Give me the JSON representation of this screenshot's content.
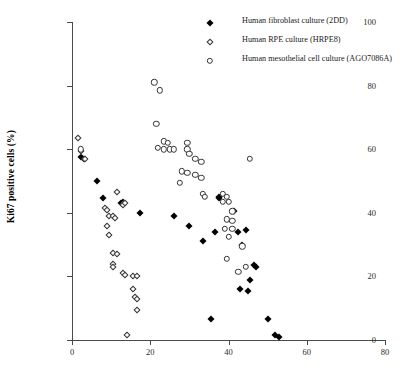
{
  "chart_data": {
    "type": "scatter",
    "title": "",
    "xlabel": "",
    "ylabel": "Ki67 positive cells (%)",
    "xlim": [
      0,
      80
    ],
    "ylim": [
      0,
      100
    ],
    "xticks": [
      0,
      20,
      40,
      60,
      80
    ],
    "yticks": [
      0,
      20,
      40,
      60,
      80,
      100
    ],
    "grid": false,
    "legend_position": "top-right",
    "series": [
      {
        "name": "Human fibroblast culture (2DD)",
        "marker": "filled-diamond",
        "color": "#000000",
        "points": [
          [
            2.4,
            57.5
          ],
          [
            3.0,
            57.0
          ],
          [
            6.5,
            50.0
          ],
          [
            8.0,
            44.5
          ],
          [
            12.5,
            43.0
          ],
          [
            13.0,
            43.5
          ],
          [
            17.5,
            40.0
          ],
          [
            26.0,
            39.0
          ],
          [
            30.0,
            36.0
          ],
          [
            33.5,
            31.0
          ],
          [
            36.5,
            34.0
          ],
          [
            37.5,
            44.5
          ],
          [
            37.5,
            45.0
          ],
          [
            41.5,
            40.5
          ],
          [
            42.5,
            34.0
          ],
          [
            43.5,
            30.0
          ],
          [
            44.5,
            34.5
          ],
          [
            45.5,
            19.0
          ],
          [
            46.5,
            23.5
          ],
          [
            47.0,
            23.0
          ],
          [
            43.0,
            16.0
          ],
          [
            45.0,
            15.5
          ],
          [
            50.0,
            6.5
          ],
          [
            52.0,
            1.5
          ],
          [
            53.0,
            1.0
          ],
          [
            35.5,
            6.5
          ]
        ]
      },
      {
        "name": "Human RPE culture (HRPE8)",
        "marker": "open-diamond",
        "color": "#333333",
        "points": [
          [
            1.5,
            63.5
          ],
          [
            2.2,
            59.5
          ],
          [
            3.2,
            57.0
          ],
          [
            11.5,
            46.5
          ],
          [
            8.5,
            41.5
          ],
          [
            9.0,
            41.0
          ],
          [
            9.5,
            39.0
          ],
          [
            10.5,
            39.0
          ],
          [
            11.0,
            38.5
          ],
          [
            13.0,
            42.5
          ],
          [
            13.5,
            43.0
          ],
          [
            9.0,
            36.0
          ],
          [
            9.5,
            33.0
          ],
          [
            10.5,
            27.5
          ],
          [
            11.5,
            27.0
          ],
          [
            10.5,
            24.0
          ],
          [
            10.5,
            23.0
          ],
          [
            13.0,
            21.0
          ],
          [
            13.5,
            20.5
          ],
          [
            15.5,
            20.0
          ],
          [
            16.5,
            20.0
          ],
          [
            15.5,
            16.0
          ],
          [
            16.0,
            13.5
          ],
          [
            16.5,
            13.0
          ],
          [
            16.5,
            9.5
          ],
          [
            14.0,
            1.5
          ]
        ]
      },
      {
        "name": "Human mesothelial cell culture (AGO7086A)",
        "marker": "open-circle",
        "color": "#333333",
        "points": [
          [
            2.3,
            60.0
          ],
          [
            21.0,
            81.0
          ],
          [
            22.5,
            78.5
          ],
          [
            21.5,
            68.0
          ],
          [
            23.5,
            62.5
          ],
          [
            24.5,
            62.0
          ],
          [
            22.0,
            60.5
          ],
          [
            23.5,
            60.0
          ],
          [
            25.0,
            60.0
          ],
          [
            26.0,
            60.0
          ],
          [
            29.5,
            62.0
          ],
          [
            29.5,
            60.0
          ],
          [
            30.0,
            58.5
          ],
          [
            31.5,
            57.0
          ],
          [
            33.0,
            56.0
          ],
          [
            28.0,
            53.0
          ],
          [
            29.5,
            52.5
          ],
          [
            31.5,
            52.0
          ],
          [
            33.0,
            51.0
          ],
          [
            27.5,
            49.5
          ],
          [
            33.5,
            46.0
          ],
          [
            34.0,
            45.0
          ],
          [
            45.5,
            57.0
          ],
          [
            38.5,
            46.0
          ],
          [
            39.5,
            45.0
          ],
          [
            38.5,
            43.5
          ],
          [
            40.0,
            43.5
          ],
          [
            41.0,
            40.5
          ],
          [
            39.5,
            38.0
          ],
          [
            41.0,
            37.5
          ],
          [
            39.0,
            35.0
          ],
          [
            41.0,
            35.0
          ],
          [
            40.0,
            32.5
          ],
          [
            43.5,
            29.5
          ],
          [
            39.5,
            25.5
          ],
          [
            44.5,
            23.0
          ],
          [
            42.5,
            21.5
          ]
        ]
      }
    ]
  },
  "axes": {
    "y_title": "Ki67 positive cells (%)",
    "y_tick_labels": [
      "0",
      "20",
      "40",
      "60",
      "80",
      "100"
    ],
    "x_tick_labels": [
      "0",
      "20",
      "40",
      "60",
      "80"
    ]
  },
  "legend": {
    "items": [
      {
        "label": "Human fibroblast culture (2DD)",
        "marker": "filled-diamond"
      },
      {
        "label": "Human RPE culture (HRPE8)",
        "marker": "open-diamond"
      },
      {
        "label": "Human mesothelial cell culture (AGO7086A)",
        "marker": "open-circle"
      }
    ]
  }
}
